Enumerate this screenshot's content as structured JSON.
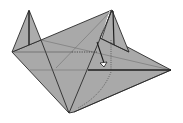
{
  "diagram": {
    "type": "origami-fold-step",
    "colors": {
      "paper": "#a9a9a9",
      "paper_light": "#b4b4b4",
      "edge": "#2a2a2a",
      "crease": "#555555",
      "arrow_fill": "#ffffff",
      "background": "#ffffff"
    },
    "elements": [
      {
        "name": "left-flap",
        "kind": "flap"
      },
      {
        "name": "right-flap",
        "kind": "flap"
      },
      {
        "name": "main-body",
        "kind": "body"
      },
      {
        "name": "right-point",
        "kind": "point"
      },
      {
        "name": "fold-arrow",
        "kind": "arrow"
      },
      {
        "name": "valley-fold-line",
        "kind": "dotted-line"
      }
    ]
  }
}
